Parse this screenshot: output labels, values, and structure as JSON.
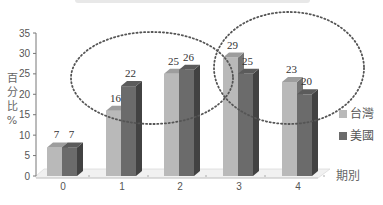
{
  "chart_data": {
    "type": "bar",
    "title": "",
    "xlabel": "期別",
    "ylabel": "百分比%",
    "ylim": [
      0,
      35
    ],
    "yticks": [
      0,
      5,
      10,
      15,
      20,
      25,
      30,
      35
    ],
    "categories": [
      "0",
      "1",
      "2",
      "3",
      "4"
    ],
    "series": [
      {
        "name": "台灣",
        "values": [
          7,
          16,
          25,
          29,
          23
        ],
        "color": "#b9b9b9"
      },
      {
        "name": "美國",
        "values": [
          7,
          22,
          26,
          25,
          20
        ],
        "color": "#6b6b6b"
      }
    ],
    "legend_position": "right",
    "annotations": [
      {
        "type": "dotted-ellipse",
        "covers_categories": [
          "1",
          "2"
        ]
      },
      {
        "type": "dotted-ellipse",
        "covers_categories": [
          "3",
          "4"
        ]
      }
    ],
    "style": "3d-column",
    "grid": false
  },
  "axis": {
    "ylabel_chars": [
      "百",
      "分",
      "比",
      "%"
    ],
    "xlabel": "期別"
  },
  "legend": {
    "items": [
      {
        "label": "台灣",
        "color": "#b9b9b9"
      },
      {
        "label": "美國",
        "color": "#6b6b6b"
      }
    ]
  }
}
